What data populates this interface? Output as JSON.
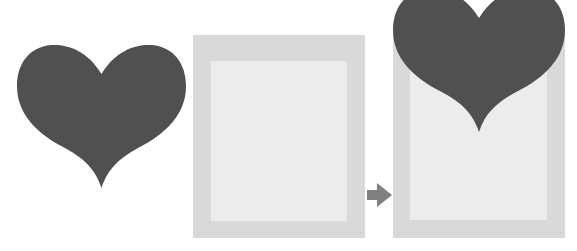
{
  "diagram": {
    "elements": [
      {
        "id": "source-heart",
        "shape": "heart",
        "color": "#505050"
      },
      {
        "id": "empty-frame",
        "shape": "frame",
        "outer_color": "#d9d9d9",
        "inner_color": "#ececec"
      },
      {
        "id": "arrow",
        "shape": "arrow-right",
        "color": "#808080"
      },
      {
        "id": "result-frame",
        "shape": "frame-with-heart",
        "outer_color": "#d9d9d9",
        "inner_color": "#ececec",
        "heart_color": "#505050"
      }
    ]
  },
  "colors": {
    "heart": "#505050",
    "frame_outer": "#d9d9d9",
    "frame_inner": "#ececec",
    "arrow": "#808080",
    "background": "#ffffff"
  }
}
